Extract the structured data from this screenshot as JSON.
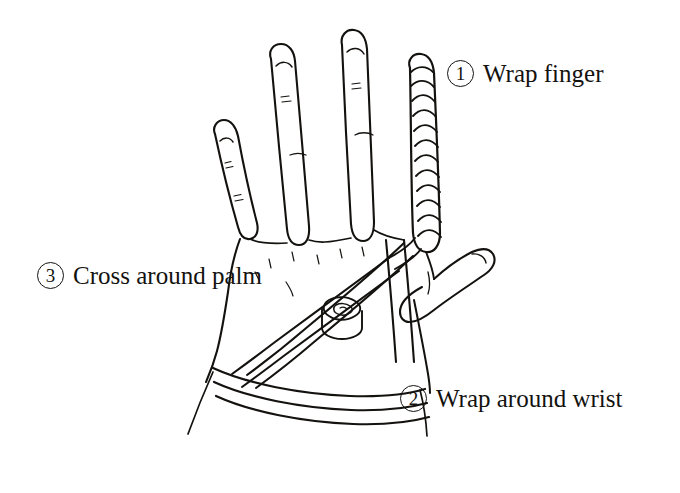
{
  "figure": {
    "background_color": "#ffffff",
    "ink_color": "#14120f",
    "style": "black-and-white line drawing"
  },
  "labels": [
    {
      "id": "wrap-finger",
      "marker": "1",
      "text": "Wrap finger",
      "points_to": "spiral-wrapped index finger"
    },
    {
      "id": "wrap-around-wrist",
      "marker": "2",
      "text": "Wrap around wrist",
      "points_to": "two tape bands encircling the wrist"
    },
    {
      "id": "cross-around-palm",
      "marker": "3",
      "text": "Cross around palm",
      "points_to": "diagonal tape strips crossing the back of the hand"
    }
  ],
  "drawing_parts": {
    "pinky_finger": "pinky",
    "ring_finger": "ring finger",
    "middle_finger": "middle finger",
    "index_finger_wrapped": "index finger with spiral tape wrap",
    "thumb": "thumb",
    "palm": "back of hand / palm",
    "wrist": "wrist",
    "tape_roll": "roll of tape",
    "bandage_strip": "tape strip",
    "wrist_band": "wrist band",
    "finger_wrap_band": "finger wrap band",
    "knuckle_crease": "knuckle crease",
    "fingernail": "fingernail"
  }
}
